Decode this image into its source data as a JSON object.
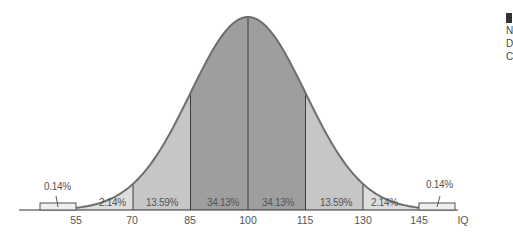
{
  "chart_data": {
    "type": "area",
    "title": "",
    "xlabel": "IQ",
    "ylabel": "",
    "distribution": "normal",
    "mean": 100,
    "sd": 15,
    "x_ticks": [
      55,
      70,
      85,
      100,
      115,
      130,
      145
    ],
    "axis_label_right": "IQ",
    "segments": [
      {
        "from": null,
        "to": 55,
        "percent": "0.14%",
        "value": 0.14
      },
      {
        "from": 55,
        "to": 70,
        "percent": "2.14%",
        "value": 2.14
      },
      {
        "from": 70,
        "to": 85,
        "percent": "13.59%",
        "value": 13.59
      },
      {
        "from": 85,
        "to": 100,
        "percent": "34.13%",
        "value": 34.13
      },
      {
        "from": 100,
        "to": 115,
        "percent": "34.13%",
        "value": 34.13
      },
      {
        "from": 115,
        "to": 130,
        "percent": "13.59%",
        "value": 13.59
      },
      {
        "from": 130,
        "to": 145,
        "percent": "2.14%",
        "value": 2.14
      },
      {
        "from": 145,
        "to": null,
        "percent": "0.14%",
        "value": 0.14
      }
    ],
    "colors": {
      "center": "#9e9e9e",
      "middle": "#c6c6c6",
      "tail": "#dedede",
      "outer": "#efefef",
      "outline": "#6e6e6e",
      "divider": "#3c3c3c"
    },
    "grid": false,
    "legend": null
  },
  "labels": {
    "tail_left": "0.14%",
    "tail_right": "0.14%",
    "seg_55_70": "2.14%",
    "seg_70_85": "13.59%",
    "seg_85_100": "34.13%",
    "seg_100_115": "34.13%",
    "seg_115_130": "13.59%",
    "seg_130_145": "2.14%",
    "tick_55": "55",
    "tick_70": "70",
    "tick_85": "85",
    "tick_100": "100",
    "tick_115": "115",
    "tick_130": "130",
    "tick_145": "145",
    "axis": "IQ"
  },
  "clipped_edge_text": [
    "N",
    "D",
    "C"
  ]
}
